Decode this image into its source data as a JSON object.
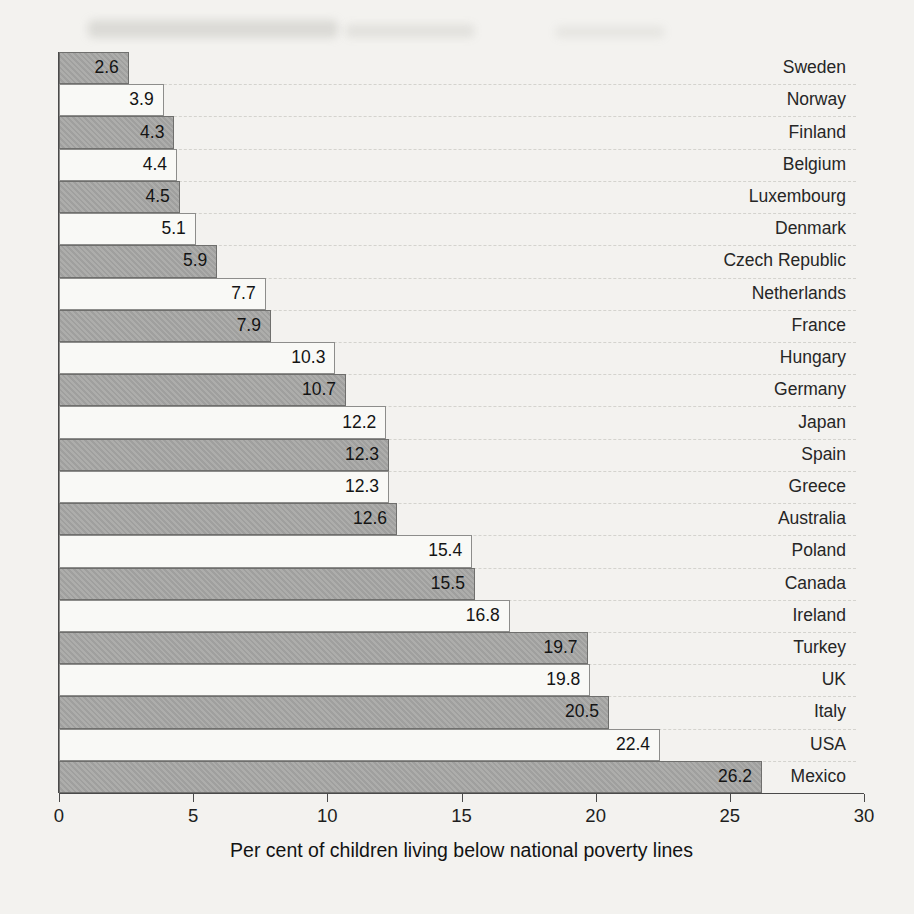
{
  "chart_data": {
    "type": "bar",
    "orientation": "horizontal",
    "title": "",
    "xlabel": "Per cent of children living below national poverty lines",
    "ylabel": "",
    "xlim": [
      0,
      30
    ],
    "x_ticks": [
      0,
      5,
      10,
      15,
      20,
      25,
      30
    ],
    "grid": false,
    "legend": false,
    "categories": [
      "Sweden",
      "Norway",
      "Finland",
      "Belgium",
      "Luxembourg",
      "Denmark",
      "Czech Republic",
      "Netherlands",
      "France",
      "Hungary",
      "Germany",
      "Japan",
      "Spain",
      "Greece",
      "Australia",
      "Poland",
      "Canada",
      "Ireland",
      "Turkey",
      "UK",
      "Italy",
      "USA",
      "Mexico"
    ],
    "values": [
      2.6,
      3.9,
      4.3,
      4.4,
      4.5,
      5.1,
      5.9,
      7.7,
      7.9,
      10.3,
      10.7,
      12.2,
      12.3,
      12.3,
      12.6,
      15.4,
      15.5,
      16.8,
      19.7,
      19.8,
      20.5,
      22.4,
      26.2
    ],
    "value_labels": [
      "2.6",
      "3.9",
      "4.3",
      "4.4",
      "4.5",
      "5.1",
      "5.9",
      "7.7",
      "7.9",
      "10.3",
      "10.7",
      "12.2",
      "12.3",
      "12.3",
      "12.6",
      "15.4",
      "15.5",
      "16.8",
      "19.7",
      "19.8",
      "20.5",
      "22.4",
      "26.2"
    ],
    "bar_style": {
      "alternating_pattern": [
        "gray",
        "light"
      ],
      "gray_fill": "#a8a8a6",
      "gray_border": "#6f6f6d",
      "light_fill": "#f9f9f6",
      "light_border": "#8d8d8b"
    }
  },
  "colors": {
    "page_background": "#f3f2ef",
    "axis": "#4a4a4a",
    "text": "#1c1c1c"
  }
}
